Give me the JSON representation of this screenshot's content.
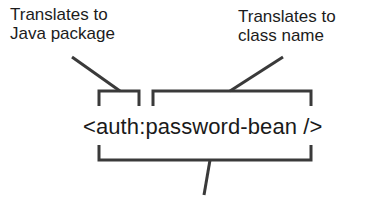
{
  "diagram": {
    "labels": {
      "prefix_note": "Translates to\nJava package",
      "name_note": "Translates to\nclass name"
    },
    "tag": "<auth:password-bean />",
    "colors": {
      "line": "#3a3a3a",
      "text": "#1a1a1a",
      "background": "#ffffff"
    }
  }
}
